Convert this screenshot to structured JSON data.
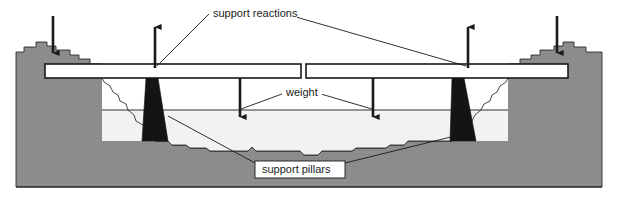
{
  "figure": {
    "type": "engineering-cross-section-diagram",
    "width": 618,
    "height": 198,
    "background_color": "#ffffff"
  },
  "colors": {
    "rock_fill": "#8c8c8c",
    "valley_fill": "#f2f2f2",
    "pillar_fill": "#141414",
    "deck_fill": "#ffffff",
    "line": "#1a1a1a",
    "label_text": "#1a1a1a",
    "label_box_fill": "#ffffff"
  },
  "labels": {
    "support_reactions": {
      "text": "support reactions",
      "x": 213,
      "y": 16,
      "boxed": false
    },
    "weight": {
      "text": "weight",
      "x": 286,
      "y": 95,
      "boxed": false
    },
    "support_pillars": {
      "text": "support pillars",
      "x": 259,
      "y": 172,
      "boxed": true
    }
  },
  "arrows": {
    "support_reaction_up_left": {
      "name": "support-reaction-arrow-up-left",
      "direction": "up",
      "x": 155,
      "y_tail": 68,
      "y_head": 20
    },
    "support_reaction_up_right": {
      "name": "support-reaction-arrow-up-right",
      "direction": "up",
      "x": 468,
      "y_tail": 68,
      "y_head": 20
    },
    "abutment_load_left": {
      "name": "abutment-load-arrow-down-left",
      "direction": "down",
      "x": 53,
      "y_tail": 16,
      "y_head": 60
    },
    "abutment_load_right": {
      "name": "abutment-load-arrow-down-right",
      "direction": "down",
      "x": 557,
      "y_tail": 16,
      "y_head": 60
    },
    "weight_left": {
      "name": "weight-arrow-down-left",
      "direction": "down",
      "x": 240,
      "y_tail": 78,
      "y_head": 124
    },
    "weight_right": {
      "name": "weight-arrow-down-right",
      "direction": "down",
      "x": 373,
      "y_tail": 78,
      "y_head": 124
    }
  },
  "components": {
    "deck_left": {
      "name": "bridge-deck-left-span",
      "x": 45,
      "y": 64,
      "width": 256,
      "height": 14
    },
    "deck_right": {
      "name": "bridge-deck-right-span",
      "x": 306,
      "y": 64,
      "width": 262,
      "height": 14
    },
    "expansion_joint": {
      "name": "expansion-joint-gap",
      "x": 301,
      "width": 5
    },
    "pillar_left": {
      "name": "support-pillar-left",
      "top_x": 145,
      "bottom_x": 142,
      "top_width": 12,
      "bottom_width": 26,
      "y_top": 78,
      "y_bottom": 141
    },
    "pillar_right": {
      "name": "support-pillar-right",
      "top_x": 462,
      "bottom_x": 450,
      "top_width": 12,
      "bottom_width": 26,
      "y_top": 78,
      "y_bottom": 141
    },
    "waterline": {
      "name": "valley-waterline",
      "y": 110
    },
    "ground_baseline": {
      "name": "ground-baseline",
      "y": 187
    }
  }
}
